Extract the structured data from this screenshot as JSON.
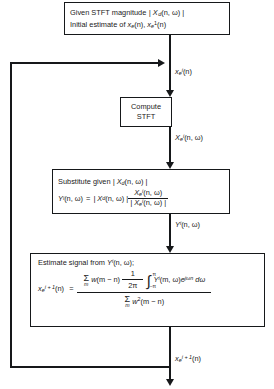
{
  "diagram": {
    "type": "flowchart"
  },
  "nodes": {
    "given": {
      "line1_a": "Given STFT magnitude",
      "line1_mag": "| X",
      "line1_sub": "d",
      "line1_args": "(n, ω) |",
      "line2_a": "Initial estimate of ",
      "line2_x1": "x",
      "line2_x1_sub": "e",
      "line2_x1_args": "(n), ",
      "line2_x2": "x",
      "line2_x2_sub": "e",
      "line2_x2_sup": "1",
      "line2_x2_args": "(n)"
    },
    "compute": {
      "line1": "Compute",
      "line2": "STFT"
    },
    "substitute": {
      "header_a": "Substitute given ",
      "header_mag": "| X",
      "header_sub": "d",
      "header_args": "(n, ω) |",
      "lhs_y": "Y",
      "lhs_sup": "i",
      "lhs_args": "(n, ω)",
      "eq": "=",
      "mag_open": "| X",
      "mag_sub": "d",
      "mag_args": "(n, ω) |",
      "num_X": "X",
      "num_sub": "e",
      "num_sup": "i",
      "num_args": "(n, ω)",
      "den_open": "| X",
      "den_sub": "e",
      "den_sup": "i",
      "den_args": "(n, ω) |"
    },
    "estimate": {
      "header_a": "Estimate signal from  ",
      "header_Y": "Y",
      "header_sup": "i",
      "header_args": "(n, ω);",
      "lhs_x": "x",
      "lhs_sub": "e",
      "lhs_sup": "i + 1",
      "lhs_args": "(n)",
      "eq": "=",
      "sum_sym": "Σ",
      "sum_idx": "m",
      "num_w": "w",
      "num_w_args": "(m − n)",
      "frac_num": "1",
      "frac_den": "2π",
      "int_sym": "∫",
      "int_hi": "π",
      "int_lo": "−π",
      "num_Y": "Y",
      "num_Y_sup": "i",
      "num_Y_args": "(m, ω)",
      "num_exp_e": "e",
      "num_exp_sup": "jωn",
      "num_domega": "dω",
      "den_w": "w",
      "den_w_sup": "2",
      "den_w_args": "(m − n)"
    }
  },
  "edges": {
    "given_to_compute": {
      "label_x": "x",
      "label_sub": "e",
      "label_sup": "i",
      "label_args": "(n)"
    },
    "compute_to_substitute": {
      "label_X": "X",
      "label_sub": "e",
      "label_sup": "i",
      "label_args": "(n, ω)"
    },
    "substitute_to_estimate": {
      "label_Y": "Y",
      "label_sup": "i",
      "label_args": "(n, ω)"
    },
    "estimate_output": {
      "label_x": "x",
      "label_sub": "e",
      "label_sup": "i + 1",
      "label_args": "(n)"
    }
  },
  "colors": {
    "stroke": "#16181a",
    "background": "#ffffff",
    "text": "#1a1a1a"
  }
}
